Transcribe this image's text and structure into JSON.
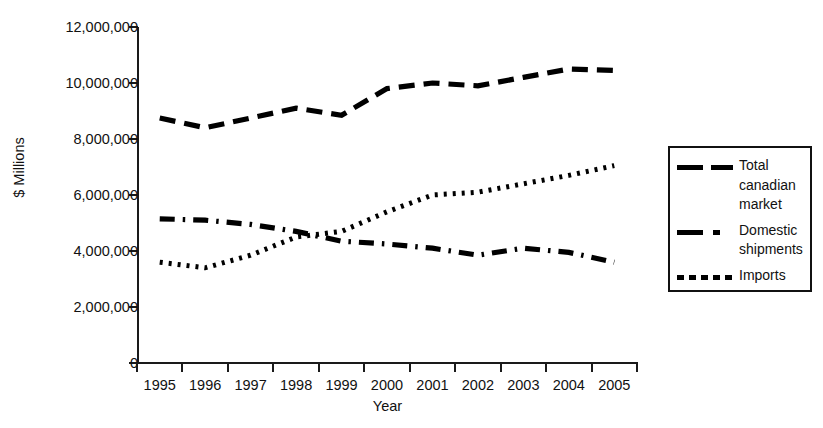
{
  "chart_data": {
    "type": "line",
    "title": "",
    "xlabel": "Year",
    "ylabel": "$ Millions",
    "x": [
      "1995",
      "1996",
      "1997",
      "1998",
      "1999",
      "2000",
      "2001",
      "2002",
      "2003",
      "2004",
      "2005"
    ],
    "categories": [
      "1995",
      "1996",
      "1997",
      "1998",
      "1999",
      "2000",
      "2001",
      "2002",
      "2003",
      "2004",
      "2005"
    ],
    "ylim": [
      0,
      12000000
    ],
    "yticks": [
      0,
      2000000,
      4000000,
      6000000,
      8000000,
      10000000,
      12000000
    ],
    "ytick_labels": [
      "0",
      "2,000,000",
      "4,000,000",
      "6,000,000",
      "8,000,000",
      "10,000,000",
      "12,000,000"
    ],
    "grid": false,
    "legend_position": "right",
    "series": [
      {
        "name": "Total canadian market",
        "dash": "long-dash",
        "color": "#000000",
        "values": [
          8750000,
          8400000,
          8750000,
          9100000,
          8850000,
          9800000,
          10000000,
          9900000,
          10200000,
          10500000,
          10450000
        ]
      },
      {
        "name": "Domestic shipments",
        "dash": "dash-dot",
        "color": "#000000",
        "values": [
          5150000,
          5100000,
          4950000,
          4700000,
          4350000,
          4250000,
          4100000,
          3850000,
          4100000,
          3950000,
          3600000
        ]
      },
      {
        "name": "Imports",
        "dash": "dotted",
        "color": "#000000",
        "values": [
          3600000,
          3400000,
          3850000,
          4500000,
          4700000,
          5400000,
          6000000,
          6100000,
          6400000,
          6700000,
          7050000
        ]
      }
    ]
  },
  "axes": {
    "y_title": "$ Millions",
    "x_title": "Year"
  },
  "legend": {
    "items": [
      {
        "label": "Total canadian market",
        "style": "long-dash"
      },
      {
        "label": "Domestic shipments",
        "style": "dash-dot"
      },
      {
        "label": "Imports",
        "style": "dotted"
      }
    ]
  }
}
